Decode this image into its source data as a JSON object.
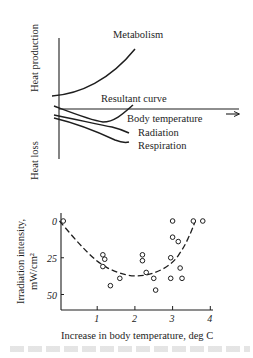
{
  "top_diagram": {
    "y_axis_top_label": "Heat production",
    "y_axis_bottom_label": "Heat loss",
    "x_axis_label": "Body temperature",
    "curves": [
      {
        "name": "Metabolism",
        "label": "Metabolism"
      },
      {
        "name": "Resultant curve",
        "label": "Resultant curve"
      },
      {
        "name": "Radiation",
        "label": "Radiation"
      },
      {
        "name": "Respiration",
        "label": "Respiration"
      }
    ]
  },
  "chart_data": {
    "type": "scatter",
    "title": "",
    "xlabel": "Increase in body temperature, deg C",
    "ylabel": "Irradiation intensity, mW/cm²",
    "ylabel_line1": "Irradiation intensity,",
    "ylabel_line2": "mW/cm²",
    "xlim": [
      0,
      4.1
    ],
    "ylim": [
      0,
      60
    ],
    "y_inverted": true,
    "x_ticks": [
      "1",
      "2",
      "3",
      "4"
    ],
    "y_ticks": [
      "0",
      "25",
      "50"
    ],
    "grid": false,
    "series": [
      {
        "name": "observations",
        "marker": "open-circle",
        "points": [
          [
            0.1,
            0
          ],
          [
            1.15,
            23
          ],
          [
            1.2,
            26
          ],
          [
            1.15,
            31
          ],
          [
            1.35,
            44
          ],
          [
            1.6,
            39
          ],
          [
            2.2,
            23
          ],
          [
            2.2,
            27
          ],
          [
            2.3,
            35
          ],
          [
            2.5,
            39
          ],
          [
            2.55,
            47
          ],
          [
            2.95,
            25
          ],
          [
            2.95,
            39
          ],
          [
            3.0,
            0
          ],
          [
            3.0,
            11
          ],
          [
            3.15,
            14
          ],
          [
            3.2,
            32
          ],
          [
            3.25,
            39
          ],
          [
            3.55,
            0
          ],
          [
            3.8,
            0
          ]
        ]
      },
      {
        "name": "fitted curve",
        "style": "dashed",
        "points": [
          [
            0,
            0
          ],
          [
            0.5,
            15
          ],
          [
            1.0,
            28
          ],
          [
            1.5,
            35
          ],
          [
            2.0,
            38
          ],
          [
            2.5,
            36
          ],
          [
            3.0,
            29
          ],
          [
            3.3,
            18
          ],
          [
            3.5,
            7
          ],
          [
            3.6,
            0
          ]
        ]
      }
    ]
  }
}
